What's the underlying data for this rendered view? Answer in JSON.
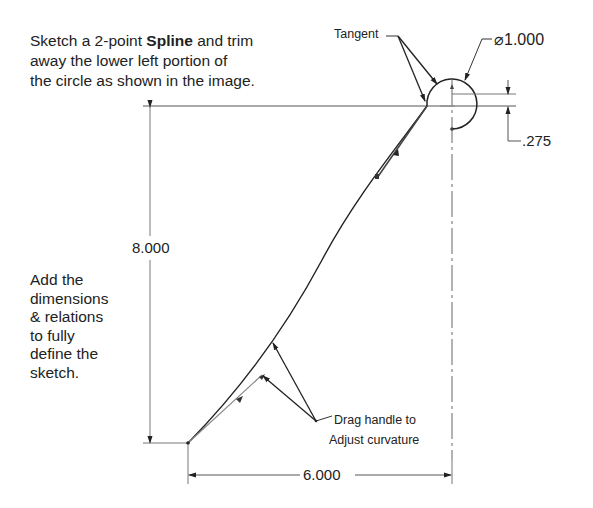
{
  "instructions": {
    "top_line1_pre": "Sketch a 2-point ",
    "top_line1_bold": "Spline",
    "top_line1_post": " and trim",
    "top_line2": "away the lower left portion of",
    "top_line3": "the circle as shown in the image.",
    "left_lines": [
      "Add the",
      "dimensions",
      "& relations",
      "to fully",
      "define the",
      "sketch."
    ]
  },
  "callouts": {
    "tangent": "Tangent",
    "drag_line1": "Drag handle to",
    "drag_line2": "Adjust curvature"
  },
  "dimensions": {
    "diameter_symbol": "⌀",
    "diameter": "1.000",
    "offset": ".275",
    "height": "8.000",
    "width": "6.000"
  },
  "colors": {
    "line": "#222222",
    "dim_line": "#555555"
  }
}
